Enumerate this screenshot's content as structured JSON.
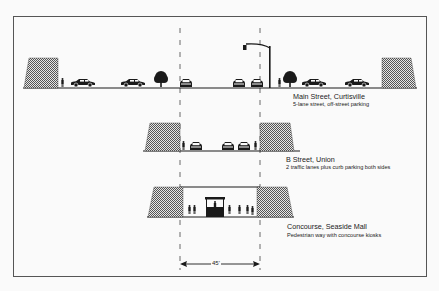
{
  "figure": {
    "sections": [
      {
        "title": "Main Street, Curtisville",
        "description": "5-lane street, off-street parking"
      },
      {
        "title": "B Street, Union",
        "description": "2 traffic lanes plus curb parking both sides"
      },
      {
        "title": "Concourse, Seaside Mall",
        "description": "Pedestrian way with concourse kiosks"
      }
    ],
    "dimension": "45'",
    "colors": {
      "ink": "#1a1a1a",
      "frame": "#555555",
      "background": "#fafafa",
      "hatch": "#777777"
    }
  }
}
